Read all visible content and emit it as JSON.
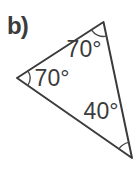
{
  "label": "b)",
  "figure": {
    "type": "triangle",
    "angles": [
      {
        "position": "top",
        "label": "70°",
        "value": 70
      },
      {
        "position": "left",
        "label": "70°",
        "value": 70
      },
      {
        "position": "bottom-right",
        "label": "40°",
        "value": 40
      }
    ]
  },
  "colors": {
    "background": "#ffffff",
    "stroke": "#3b3b3b",
    "text": "#3b3b3b"
  }
}
